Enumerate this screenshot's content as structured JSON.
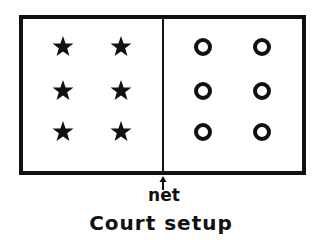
{
  "figure": {
    "caption": "Court setup",
    "net_label": "net",
    "background_color": "#ffffff",
    "ink_color": "#111111"
  },
  "court": {
    "name": "court-rectangle",
    "x": 19,
    "y": 15,
    "width": 287,
    "height": 160,
    "border_width": 4
  },
  "net": {
    "name": "net-line",
    "x": 163,
    "y_top": 15,
    "y_bottom": 175,
    "stroke_width": 2,
    "arrow": {
      "tip_x": 163,
      "tip_y": 176,
      "tail_y": 190
    }
  },
  "left_side": {
    "marker_type": "star",
    "marker_count": 6,
    "columns_x": [
      63,
      121
    ],
    "rows_y": [
      47,
      91,
      132
    ],
    "marker_size": 22
  },
  "right_side": {
    "marker_type": "circle",
    "marker_count": 6,
    "columns_x": [
      203,
      262
    ],
    "rows_y": [
      47,
      91,
      132
    ],
    "marker_radius": 7,
    "marker_stroke_width": 4
  },
  "labels": {
    "net": {
      "text": "net",
      "x": 164,
      "y": 201,
      "font_size": 17
    },
    "caption": {
      "text": "Court setup",
      "x": 161,
      "y": 230,
      "font_size": 20
    }
  }
}
